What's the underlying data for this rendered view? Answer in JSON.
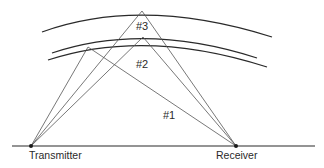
{
  "diagram": {
    "type": "radio-propagation-paths",
    "colors": {
      "line": "#2a2a2a",
      "ray": "#555555",
      "background": "#ffffff"
    },
    "nodes": {
      "transmitter": {
        "label": "Transmitter",
        "x": 31,
        "y": 146
      },
      "receiver": {
        "label": "Receiver",
        "x": 236,
        "y": 146
      }
    },
    "ground": {
      "x1": 12,
      "x2": 315,
      "y": 146
    },
    "layers": [
      {
        "name": "outer-layer",
        "path": "M42 32 Q142 -4 272 37"
      },
      {
        "name": "middle-layer-upper",
        "path": "M52 53 Q145 22 257 58"
      },
      {
        "name": "middle-layer-lower",
        "path": "M48 60 Q146 28 267 67"
      }
    ],
    "paths": [
      {
        "id": "1",
        "label": "#1",
        "apex": {
          "x": 88,
          "y": 47
        },
        "label_pos": {
          "x": 163,
          "y": 109
        }
      },
      {
        "id": "2",
        "label": "#2",
        "apex": {
          "x": 143,
          "y": 37
        },
        "label_pos": {
          "x": 136,
          "y": 58
        }
      },
      {
        "id": "3",
        "label": "#3",
        "apex": {
          "x": 142,
          "y": 11
        },
        "label_pos": {
          "x": 136,
          "y": 20
        }
      }
    ]
  }
}
